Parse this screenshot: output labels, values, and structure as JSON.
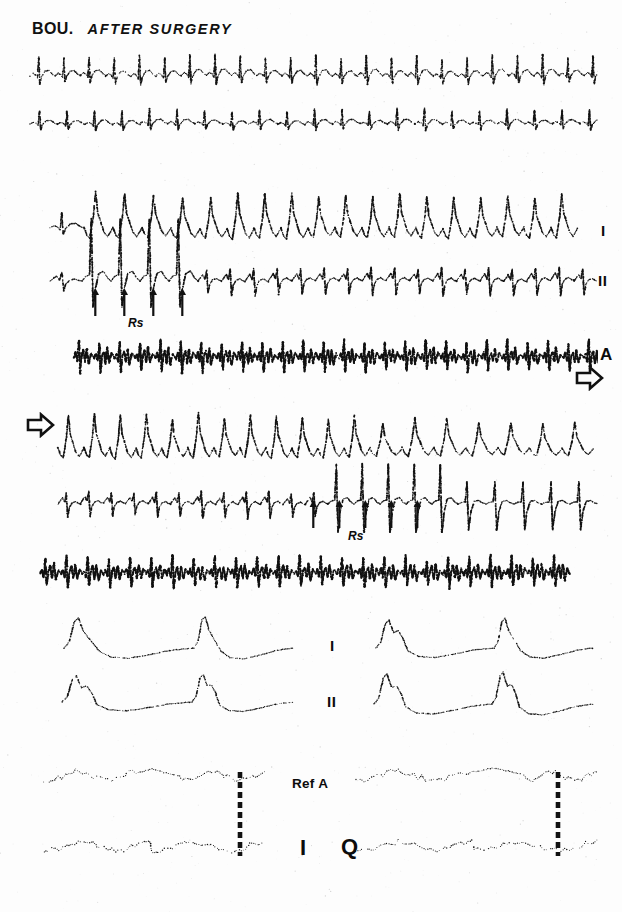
{
  "figure": {
    "title_subject": "BOU.",
    "title_condition": "AFTER SURGERY",
    "background_color": "#fdfdfd",
    "trace_color": "#111111"
  },
  "labels": {
    "lead_I": "I",
    "lead_II": "II",
    "lead_A": "A",
    "lead_Q": "Q",
    "lead_I_big": "I",
    "ref_a": "Ref A",
    "rs_marker": "Rs",
    "continuation_arrow": "arrow-right-outline"
  },
  "panels": [
    {
      "id": "panel-top",
      "name": "baseline-rhythm-strip",
      "rows": [
        {
          "name": "row-1-surface-lead",
          "label": ""
        },
        {
          "name": "row-2-surface-lead",
          "label": ""
        }
      ]
    },
    {
      "id": "panel-stim-1",
      "name": "stimulation-strip-part-1",
      "rows": [
        {
          "name": "row-lead-I",
          "label": "I"
        },
        {
          "name": "row-lead-II",
          "label": "II"
        },
        {
          "name": "row-atrial-electrogram",
          "label": "A"
        }
      ],
      "markers": {
        "label": "Rs",
        "arrow_count": 4
      },
      "continues_right": true
    },
    {
      "id": "panel-stim-2",
      "name": "stimulation-strip-part-2",
      "rows": [
        {
          "name": "row-lead-I",
          "label": ""
        },
        {
          "name": "row-lead-II",
          "label": ""
        },
        {
          "name": "row-atrial-electrogram",
          "label": ""
        }
      ],
      "markers": {
        "label": "Rs",
        "arrow_count": 5
      },
      "continues_from_left": true
    },
    {
      "id": "panel-expanded",
      "name": "expanded-beat-comparison",
      "rows": [
        {
          "name": "row-lead-I",
          "label": "I"
        },
        {
          "name": "row-lead-II",
          "label": "II"
        }
      ],
      "groups": [
        "left-group",
        "right-group"
      ]
    },
    {
      "id": "panel-ref",
      "name": "reference-atrial-timing",
      "rows": [
        {
          "name": "row-ref-a",
          "label": "Ref A"
        },
        {
          "name": "row-q",
          "label": "Q"
        }
      ],
      "timing_marker_count": 2
    }
  ],
  "chart_data": {
    "type": "line",
    "xlabel": "",
    "ylabel": "",
    "series": [
      {
        "name": "row-1-surface-lead",
        "lead": "",
        "beats": 22,
        "morphology": "sinus-rhythm-narrow"
      },
      {
        "name": "row-2-surface-lead",
        "lead": "",
        "beats": 20,
        "morphology": "sinus-rhythm-narrow"
      },
      {
        "name": "panel-stim-1-lead-I",
        "lead": "I",
        "beats": 19,
        "morphology": "tall-positive-deflections"
      },
      {
        "name": "panel-stim-1-lead-II",
        "lead": "II",
        "beats": 22,
        "morphology": "biphasic-with-spikes"
      },
      {
        "name": "panel-stim-1-atrial",
        "lead": "A",
        "beats": 26,
        "morphology": "dense-sharp-atrial-spikes"
      },
      {
        "name": "panel-stim-2-lead-I",
        "lead": "",
        "beats": 20,
        "morphology": "tall-positive-deflections"
      },
      {
        "name": "panel-stim-2-lead-II",
        "lead": "",
        "beats": 21,
        "morphology": "biphasic-with-large-spikes"
      },
      {
        "name": "panel-stim-2-atrial",
        "lead": "",
        "beats": 25,
        "morphology": "dense-sharp-atrial-spikes"
      },
      {
        "name": "expanded-left-lead-I",
        "lead": "I",
        "beats": 2,
        "morphology": "expanded-qrs-t"
      },
      {
        "name": "expanded-left-lead-II",
        "lead": "II",
        "beats": 2,
        "morphology": "expanded-qrs-t"
      },
      {
        "name": "expanded-right-lead-I",
        "lead": "",
        "beats": 2,
        "morphology": "expanded-qrs-t"
      },
      {
        "name": "expanded-right-lead-II",
        "lead": "",
        "beats": 2,
        "morphology": "expanded-qrs-t"
      },
      {
        "name": "ref-a-left",
        "lead": "Ref A",
        "beats": 2,
        "morphology": "low-amplitude-atrial"
      },
      {
        "name": "ref-a-right",
        "lead": "",
        "beats": 2,
        "morphology": "low-amplitude-atrial"
      },
      {
        "name": "q-left",
        "lead": "Q",
        "beats": 2,
        "morphology": "low-amplitude"
      },
      {
        "name": "q-right",
        "lead": "",
        "beats": 2,
        "morphology": "low-amplitude"
      }
    ],
    "grid": false,
    "legend_position": "right"
  }
}
